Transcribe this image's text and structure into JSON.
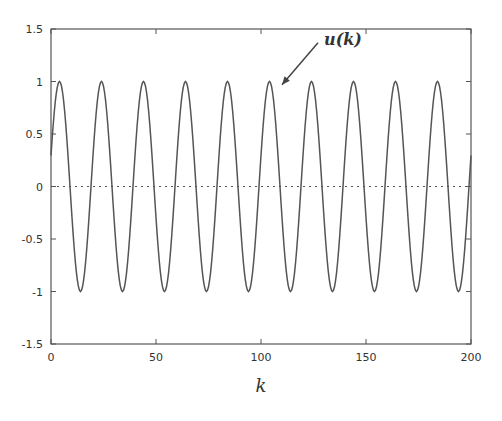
{
  "chart_data": {
    "type": "line",
    "title": "",
    "xlabel": "k",
    "ylabel": "",
    "xlim": [
      0,
      200
    ],
    "ylim": [
      -1.5,
      1.5
    ],
    "xticks": [
      0,
      50,
      100,
      150,
      200
    ],
    "xtick_labels": [
      "0",
      "50",
      "100",
      "150",
      "200"
    ],
    "yticks": [
      1.5,
      1,
      0.5,
      0,
      -0.5,
      -1,
      -1.5
    ],
    "ytick_labels": [
      "1.5",
      "1",
      "0.5",
      "0",
      "-0.5",
      "-1",
      "-1.5"
    ],
    "grid": false,
    "legend": null,
    "series": [
      {
        "name": "u(k)",
        "style": "solid",
        "color": "#555555",
        "formula": "sin(2*pi*k/20 + 0.3)",
        "amplitude": 1,
        "period": 20,
        "phase": 0.3,
        "k_range": [
          0,
          200
        ],
        "samples": 401
      },
      {
        "name": "zero reference",
        "style": "dotted",
        "color": "#555555",
        "x": [
          0,
          200
        ],
        "y": [
          0,
          0
        ]
      }
    ],
    "annotations": [
      {
        "text": "u(k)",
        "text_at": [
          130,
          1.35
        ],
        "arrow_to": [
          110,
          0.97
        ]
      }
    ]
  }
}
